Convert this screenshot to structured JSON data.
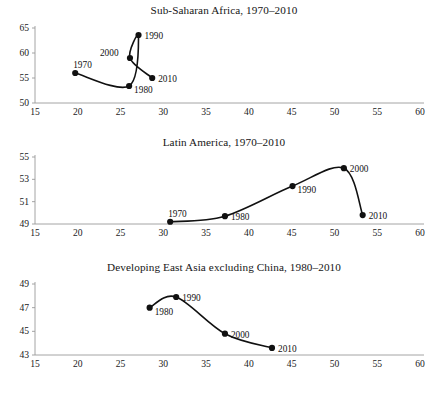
{
  "figure": {
    "background": "#ffffff",
    "line_color": "#111111",
    "marker_color": "#111111",
    "axis_color": "#9a9a9a"
  },
  "charts": [
    {
      "id": "sub-saharan-africa",
      "type": "line",
      "title": "Sub-Saharan Africa, 1970–2010",
      "xlabel": "",
      "ylabel": "",
      "xlim": [
        15,
        60
      ],
      "ylim": [
        50,
        65
      ],
      "xticks": [
        15,
        20,
        25,
        30,
        35,
        40,
        45,
        50,
        55,
        60
      ],
      "yticks": [
        50,
        55,
        60,
        65
      ],
      "grid": false,
      "legend": "none",
      "point_labels": [
        "1970",
        "1980",
        "1990",
        "2000",
        "2010"
      ],
      "x": [
        19.7,
        26.0,
        27.1,
        26.1,
        28.7
      ],
      "y": [
        56.0,
        53.4,
        63.6,
        59.0,
        55.0
      ],
      "points": [
        {
          "label": "1970",
          "x": 19.7,
          "y": 56.0,
          "label_pos": "above-right"
        },
        {
          "label": "1980",
          "x": 26.0,
          "y": 53.4,
          "label_pos": "below-right"
        },
        {
          "label": "1990",
          "x": 27.1,
          "y": 63.6,
          "label_pos": "right"
        },
        {
          "label": "2000",
          "x": 26.1,
          "y": 59.0,
          "label_pos": "left"
        },
        {
          "label": "2010",
          "x": 28.7,
          "y": 55.0,
          "label_pos": "right"
        }
      ]
    },
    {
      "id": "latin-america",
      "type": "line",
      "title": "Latin America, 1970–2010",
      "xlabel": "",
      "ylabel": "",
      "xlim": [
        15,
        60
      ],
      "ylim": [
        49,
        55
      ],
      "xticks": [
        15,
        20,
        25,
        30,
        35,
        40,
        45,
        50,
        55,
        60
      ],
      "yticks": [
        49,
        51,
        53,
        55
      ],
      "grid": false,
      "legend": "none",
      "point_labels": [
        "1970",
        "1980",
        "1990",
        "2000",
        "2010"
      ],
      "x": [
        30.8,
        37.2,
        45.1,
        51.1,
        53.3
      ],
      "y": [
        49.2,
        49.7,
        52.4,
        54.0,
        49.8
      ],
      "points": [
        {
          "label": "1970",
          "x": 30.8,
          "y": 49.2,
          "label_pos": "above-right"
        },
        {
          "label": "1980",
          "x": 37.2,
          "y": 49.7,
          "label_pos": "right"
        },
        {
          "label": "1990",
          "x": 45.1,
          "y": 52.4,
          "label_pos": "below-right"
        },
        {
          "label": "2000",
          "x": 51.1,
          "y": 54.0,
          "label_pos": "right"
        },
        {
          "label": "2010",
          "x": 53.3,
          "y": 49.8,
          "label_pos": "right"
        }
      ]
    },
    {
      "id": "developing-east-asia-excluding-china",
      "type": "line",
      "title": "Developing East Asia excluding China, 1980–2010",
      "xlabel": "",
      "ylabel": "",
      "xlim": [
        15,
        60
      ],
      "ylim": [
        43,
        49
      ],
      "xticks": [
        15,
        20,
        25,
        30,
        35,
        40,
        45,
        50,
        55,
        60
      ],
      "yticks": [
        43,
        45,
        47,
        49
      ],
      "grid": false,
      "legend": "none",
      "point_labels": [
        "1980",
        "1990",
        "2000",
        "2010"
      ],
      "x": [
        28.4,
        31.5,
        37.2,
        42.7
      ],
      "y": [
        47.0,
        47.9,
        44.8,
        43.6
      ],
      "points": [
        {
          "label": "1980",
          "x": 28.4,
          "y": 47.0,
          "label_pos": "below-right"
        },
        {
          "label": "1990",
          "x": 31.5,
          "y": 47.9,
          "label_pos": "right"
        },
        {
          "label": "2000",
          "x": 37.2,
          "y": 44.8,
          "label_pos": "right"
        },
        {
          "label": "2010",
          "x": 42.7,
          "y": 43.6,
          "label_pos": "right"
        }
      ]
    }
  ],
  "chart_data": [
    {
      "type": "line",
      "title": "Sub-Saharan Africa, 1970–2010",
      "xlabel": "",
      "ylabel": "",
      "xlim": [
        15,
        60
      ],
      "ylim": [
        50,
        65
      ],
      "xticks": [
        15,
        20,
        25,
        30,
        35,
        40,
        45,
        50,
        55,
        60
      ],
      "yticks": [
        50,
        55,
        60,
        65
      ],
      "grid": false,
      "legend": "none",
      "annotations": [
        "1970",
        "1980",
        "1990",
        "2000",
        "2010"
      ],
      "series": [
        {
          "name": "Sub-Saharan Africa",
          "x": [
            19.7,
            26.0,
            27.1,
            26.1,
            28.7
          ],
          "values": [
            56.0,
            53.4,
            63.6,
            59.0,
            55.0
          ],
          "point_labels": [
            "1970",
            "1980",
            "1990",
            "2000",
            "2010"
          ]
        }
      ]
    },
    {
      "type": "line",
      "title": "Latin America, 1970–2010",
      "xlabel": "",
      "ylabel": "",
      "xlim": [
        15,
        60
      ],
      "ylim": [
        49,
        55
      ],
      "xticks": [
        15,
        20,
        25,
        30,
        35,
        40,
        45,
        50,
        55,
        60
      ],
      "yticks": [
        49,
        51,
        53,
        55
      ],
      "grid": false,
      "legend": "none",
      "annotations": [
        "1970",
        "1980",
        "1990",
        "2000",
        "2010"
      ],
      "series": [
        {
          "name": "Latin America",
          "x": [
            30.8,
            37.2,
            45.1,
            51.1,
            53.3
          ],
          "values": [
            49.2,
            49.7,
            52.4,
            54.0,
            49.8
          ],
          "point_labels": [
            "1970",
            "1980",
            "1990",
            "2000",
            "2010"
          ]
        }
      ]
    },
    {
      "type": "line",
      "title": "Developing East Asia excluding China, 1980–2010",
      "xlabel": "",
      "ylabel": "",
      "xlim": [
        15,
        60
      ],
      "ylim": [
        43,
        49
      ],
      "xticks": [
        15,
        20,
        25,
        30,
        35,
        40,
        45,
        50,
        55,
        60
      ],
      "yticks": [
        43,
        45,
        47,
        49
      ],
      "grid": false,
      "legend": "none",
      "annotations": [
        "1980",
        "1990",
        "2000",
        "2010"
      ],
      "series": [
        {
          "name": "Developing East Asia excluding China",
          "x": [
            28.4,
            31.5,
            37.2,
            42.7
          ],
          "values": [
            47.0,
            47.9,
            44.8,
            43.6
          ],
          "point_labels": [
            "1980",
            "1990",
            "2000",
            "2010"
          ]
        }
      ]
    }
  ]
}
